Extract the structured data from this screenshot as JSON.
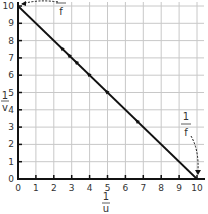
{
  "chart_data": {
    "type": "line",
    "title": "",
    "xlabel": "1/u",
    "ylabel": "1/v",
    "xlabel_num": "1",
    "xlabel_den": "u",
    "ylabel_num": "1",
    "ylabel_den": "v",
    "xlim": [
      0,
      10
    ],
    "ylim": [
      0,
      10
    ],
    "grid": true,
    "xticks": [
      0,
      1,
      2,
      3,
      4,
      5,
      6,
      7,
      8,
      9,
      10
    ],
    "yticks": [
      0,
      1,
      2,
      3,
      4,
      5,
      6,
      7,
      8,
      9,
      10
    ],
    "series": [
      {
        "name": "best-fit line",
        "x": [
          0,
          10
        ],
        "y": [
          10,
          0
        ]
      },
      {
        "name": "data points",
        "x": [
          2.5,
          2.9,
          3.3,
          4.0,
          5.0,
          6.7
        ],
        "y": [
          7.5,
          7.1,
          6.7,
          6.0,
          5.0,
          3.3
        ]
      }
    ],
    "annotations": [
      {
        "text_num": "1",
        "text_den": "f",
        "target": [
          0,
          10
        ],
        "note": "y-intercept = 1/f"
      },
      {
        "text_num": "1",
        "text_den": "f",
        "target": [
          10,
          0
        ],
        "note": "x-intercept = 1/f"
      }
    ],
    "colors": {
      "line": "#111111",
      "grid": "#c8c8c8",
      "axis": "#111111"
    }
  }
}
